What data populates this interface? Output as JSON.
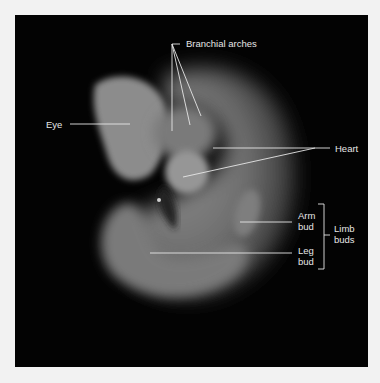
{
  "figure": {
    "background_color": "#030303",
    "frame_color": "#f2f2f2",
    "label_color": "#e6e6e6"
  },
  "labels": {
    "branchial_arches": "Branchial arches",
    "eye": "Eye",
    "heart": "Heart",
    "arm_bud_line1": "Arm",
    "arm_bud_line2": "bud",
    "leg_bud_line1": "Leg",
    "leg_bud_line2": "bud",
    "limb_buds_line1": "Limb",
    "limb_buds_line2": "buds"
  }
}
